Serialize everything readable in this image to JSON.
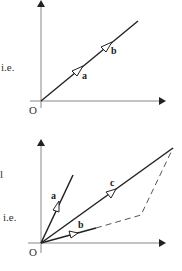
{
  "diagram_top": {
    "side_text": "i.e.",
    "origin_label": "O",
    "vectors": [
      {
        "label": "a"
      },
      {
        "label": "b"
      }
    ]
  },
  "diagram_bottom": {
    "partial_text": "ll",
    "side_text": "i.e.",
    "origin_label": "O",
    "vectors": [
      {
        "label": "a"
      },
      {
        "label": "b"
      },
      {
        "label": "c"
      }
    ]
  },
  "colors": {
    "axis": "#888888",
    "vector": "#222222",
    "dashed": "#555555"
  }
}
